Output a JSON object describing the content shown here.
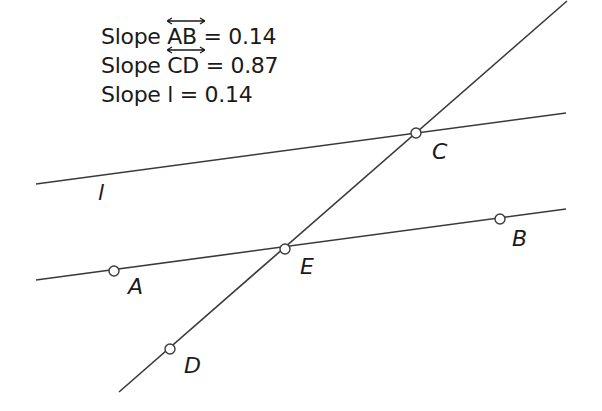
{
  "figure": {
    "background": "#ffffff",
    "stroke_color": "#3a3a3a",
    "measurements": [
      {
        "prefix": "Slope ",
        "line_name": "AB",
        "line_notation": "overline-double-arrow",
        "equals": " = ",
        "value": "0.14"
      },
      {
        "prefix": "Slope ",
        "line_name": "CD",
        "line_notation": "overline-double-arrow",
        "equals": " = ",
        "value": "0.87"
      },
      {
        "prefix": "Slope ",
        "line_name": "l",
        "line_notation": "none",
        "equals": " = ",
        "value": "0.14"
      }
    ],
    "lines": [
      {
        "name": "l",
        "x1": 36,
        "y1": 184,
        "x2": 566,
        "y2": 113
      },
      {
        "name": "AB",
        "x1": 36,
        "y1": 280,
        "x2": 566,
        "y2": 209
      },
      {
        "name": "CD",
        "x1": 119,
        "y1": 392,
        "x2": 567,
        "y2": 1
      }
    ],
    "points": [
      {
        "name": "A",
        "x": 114,
        "y": 271,
        "label_x": 128,
        "label_y": 276
      },
      {
        "name": "B",
        "x": 500,
        "y": 219,
        "label_x": 512,
        "label_y": 228
      },
      {
        "name": "C",
        "x": 416,
        "y": 133,
        "label_x": 432,
        "label_y": 141
      },
      {
        "name": "D",
        "x": 170,
        "y": 349,
        "label_x": 184,
        "label_y": 355
      },
      {
        "name": "E",
        "x": 285,
        "y": 249,
        "label_x": 300,
        "label_y": 256
      }
    ],
    "line_labels": [
      {
        "name": "l",
        "x": 98,
        "y": 182
      }
    ]
  }
}
